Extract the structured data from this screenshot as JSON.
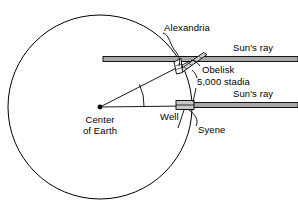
{
  "diagram": {
    "background_color": "#ffffff",
    "stroke_color": "#000000",
    "ray_fill_color": "#a8a8a8",
    "obelisk_fill_color": "#d0d0d0",
    "well_fill_color": "#c8c8c8",
    "labels": {
      "alexandria": "Alexandria",
      "obelisk": "Obelisk",
      "sun_ray_top": "Sun's ray",
      "sun_ray_bottom": "Sun's ray",
      "stadia": "5,000 stadia",
      "well": "Well",
      "syene": "Syene",
      "center_line1": "Center",
      "center_line2": "of Earth"
    },
    "geometry": {
      "earth_center_x": 100,
      "earth_center_y": 107,
      "earth_radius": 92,
      "top_ray_y": 59,
      "bottom_ray_y": 105,
      "angle_arc_degrees": 7.2
    }
  }
}
